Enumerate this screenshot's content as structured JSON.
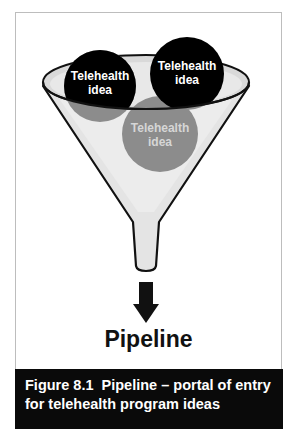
{
  "figure": {
    "label": "Figure 8.1",
    "title": "Pipeline – portal of entry for telehealth program ideas",
    "caption_line1": "Figure 8.1  Pipeline – portal of entry",
    "caption_line2": "for telehealth program ideas"
  },
  "diagram": {
    "funnel_output_label": "Pipeline",
    "ideas": [
      {
        "line1": "Telehealth",
        "line2": "idea",
        "color": "#000000",
        "position": "left-top"
      },
      {
        "line1": "Telehealth",
        "line2": "idea",
        "color": "#000000",
        "position": "right-top"
      },
      {
        "line1": "Telehealth",
        "line2": "idea",
        "color": "#8c8c8c",
        "position": "center-inside"
      }
    ],
    "colors": {
      "funnel_fill": "#e6e6e6",
      "funnel_outline": "#111111",
      "idea_dark": "#000000",
      "idea_gray": "#8c8c8c",
      "arrow": "#111111",
      "caption_bg": "#0a0a0a",
      "caption_text": "#ffffff"
    }
  }
}
